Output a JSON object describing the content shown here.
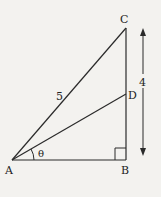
{
  "diagram": {
    "type": "right-triangle",
    "colors": {
      "background": "#f3f2ef",
      "stroke": "#2a2a2a",
      "text": "#222222"
    },
    "points": {
      "A": {
        "label": "A",
        "x": 12,
        "y": 160
      },
      "B": {
        "label": "B",
        "x": 126,
        "y": 160
      },
      "C": {
        "label": "C",
        "x": 126,
        "y": 28
      },
      "D": {
        "label": "D",
        "x": 126,
        "y": 94
      }
    },
    "segments": [
      {
        "from": "A",
        "to": "B"
      },
      {
        "from": "B",
        "to": "C"
      },
      {
        "from": "A",
        "to": "C",
        "label": "5"
      },
      {
        "from": "A",
        "to": "D"
      }
    ],
    "labels": {
      "hypotenuse": "5",
      "height": "4",
      "angle": "θ"
    },
    "right_angle_at": "B",
    "dimension_arrow": {
      "from_y": 28,
      "to_y": 155,
      "x": 143,
      "label": "4"
    }
  }
}
